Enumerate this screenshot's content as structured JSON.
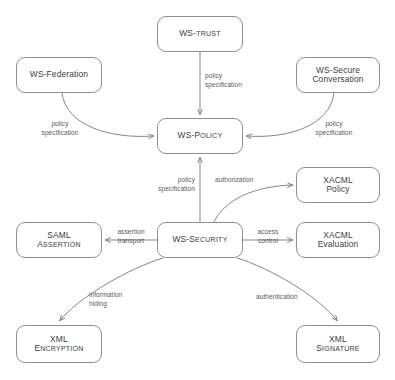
{
  "diagram": {
    "type": "flow-diagram",
    "canvas": {
      "width": 395,
      "height": 380
    },
    "style": {
      "node_stroke": "#8d8f92",
      "node_fill": "#ffffff",
      "edge_stroke": "#6f7174",
      "text_color": "#3c3c3c",
      "label_color": "#5b5b5b",
      "background": "#ffffff"
    },
    "nodes": [
      {
        "id": "ws-trust",
        "lines": [
          "WS-TRUST"
        ],
        "caps": [
          "WS-T|RUST"
        ],
        "x": 157,
        "y": 16,
        "w": 86,
        "h": 36,
        "style": "smallcaps"
      },
      {
        "id": "ws-federation",
        "lines": [
          "WS-Federation"
        ],
        "caps": [],
        "x": 16,
        "y": 57,
        "w": 86,
        "h": 36,
        "style": "plain"
      },
      {
        "id": "ws-secure-conversation",
        "lines": [
          "WS-Secure",
          "Conversation"
        ],
        "caps": [],
        "x": 296,
        "y": 57,
        "w": 84,
        "h": 36,
        "style": "plain"
      },
      {
        "id": "ws-policy",
        "lines": [
          "WS-POLICY"
        ],
        "caps": [
          "WS-P|OLICY"
        ],
        "x": 157,
        "y": 118,
        "w": 86,
        "h": 36,
        "style": "smallcaps"
      },
      {
        "id": "xacml-policy",
        "lines": [
          "XACML",
          "Policy"
        ],
        "caps": [],
        "x": 296,
        "y": 167,
        "w": 84,
        "h": 36,
        "style": "plain"
      },
      {
        "id": "saml-assertion",
        "lines": [
          "SAML",
          "ASSERTION"
        ],
        "caps": [
          "SAML",
          "A|SSERTION"
        ],
        "x": 16,
        "y": 222,
        "w": 86,
        "h": 36,
        "style": "smallcaps"
      },
      {
        "id": "ws-security",
        "lines": [
          "WS-SECURITY"
        ],
        "caps": [
          "WS-S|ECURITY"
        ],
        "x": 157,
        "y": 222,
        "w": 86,
        "h": 36,
        "style": "smallcaps"
      },
      {
        "id": "xacml-evaluation",
        "lines": [
          "XACML",
          "Evaluation"
        ],
        "caps": [],
        "x": 296,
        "y": 222,
        "w": 84,
        "h": 36,
        "style": "plain"
      },
      {
        "id": "xml-encryption",
        "lines": [
          "XML",
          "ENCRYPTION"
        ],
        "caps": [
          "XML",
          "E|NCRYPTION"
        ],
        "x": 16,
        "y": 325,
        "w": 86,
        "h": 38,
        "style": "smallcaps"
      },
      {
        "id": "xml-signature",
        "lines": [
          "XML",
          "SIGNATURE"
        ],
        "caps": [
          "XML",
          "S|IGNATURE"
        ],
        "x": 296,
        "y": 325,
        "w": 84,
        "h": 38,
        "style": "smallcaps"
      }
    ],
    "edges": [
      {
        "id": "trust-to-policy",
        "from": "ws-trust",
        "to": "ws-policy",
        "label": [
          "policy",
          "specification"
        ]
      },
      {
        "id": "federation-to-policy",
        "from": "ws-federation",
        "to": "ws-policy",
        "label": [
          "policy",
          "specification"
        ]
      },
      {
        "id": "secureconv-to-policy",
        "from": "ws-secure-conversation",
        "to": "ws-policy",
        "label": [
          "policy",
          "specification"
        ]
      },
      {
        "id": "security-to-policy",
        "from": "ws-security",
        "to": "ws-policy",
        "label": [
          "policy",
          "specification"
        ]
      },
      {
        "id": "security-to-xacmlpolicy",
        "from": "ws-security",
        "to": "xacml-policy",
        "label": [
          "authorization"
        ]
      },
      {
        "id": "security-to-saml",
        "from": "ws-security",
        "to": "saml-assertion",
        "label": [
          "assertion",
          "transport"
        ]
      },
      {
        "id": "security-to-xacmleval",
        "from": "ws-security",
        "to": "xacml-evaluation",
        "label": [
          "access",
          "control"
        ]
      },
      {
        "id": "security-to-xmlenc",
        "from": "ws-security",
        "to": "xml-encryption",
        "label": [
          "information",
          "hiding"
        ]
      },
      {
        "id": "security-to-xmlsig",
        "from": "ws-security",
        "to": "xml-signature",
        "label": [
          "authentication"
        ]
      }
    ],
    "edge_labels": {
      "trust_policy_l1": "policy",
      "trust_policy_l2": "specification",
      "federation_policy_l1": "policy",
      "federation_policy_l2": "specification",
      "secureconv_policy_l1": "policy",
      "secureconv_policy_l2": "specification",
      "security_policy_l1": "policy",
      "security_policy_l2": "specification",
      "authorization": "authorization",
      "assertion_l1": "assertion",
      "assertion_l2": "transport",
      "access_l1": "access",
      "access_l2": "control",
      "information_l1": "information",
      "information_l2": "hiding",
      "authentication": "authentication"
    },
    "node_text": {
      "ws_trust": "WS-TRUST",
      "ws_federation": "WS-Federation",
      "ws_secure_l1": "WS-Secure",
      "ws_secure_l2": "Conversation",
      "ws_policy": "WS-POLICY",
      "xacml_policy_l1": "XACML",
      "xacml_policy_l2": "Policy",
      "saml_l1": "SAML",
      "saml_l2": "ASSERTION",
      "ws_security": "WS-SECURITY",
      "xacml_eval_l1": "XACML",
      "xacml_eval_l2": "Evaluation",
      "xml_enc_l1": "XML",
      "xml_enc_l2": "ENCRYPTION",
      "xml_sig_l1": "XML",
      "xml_sig_l2": "SIGNATURE"
    }
  }
}
